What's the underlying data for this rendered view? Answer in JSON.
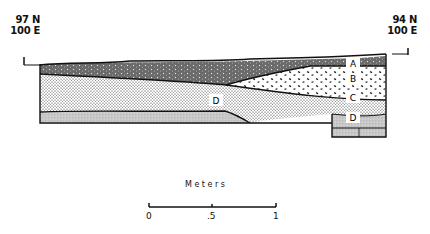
{
  "profile": {
    "left_coordinate": {
      "north": "97 N",
      "east": "100 E"
    },
    "right_coordinate": {
      "north": "94 N",
      "east": "100 E"
    },
    "layers": [
      {
        "label": "A",
        "pattern": "dark-stippled"
      },
      {
        "label": "B",
        "pattern": "dashed-flecks"
      },
      {
        "label": "C",
        "pattern": "dense-dots"
      },
      {
        "label": "D",
        "pattern": "fine-gray-speckle"
      },
      {
        "label": "D",
        "pattern": "fine-gray-speckle"
      }
    ]
  },
  "scale_bar": {
    "title": "Meters",
    "ticks": [
      "0",
      ".5",
      "1"
    ]
  },
  "colors": {
    "ink": "#111111",
    "layer_a": "#6a6a6a",
    "layer_d": "#c9c9c9",
    "background": "#ffffff"
  }
}
